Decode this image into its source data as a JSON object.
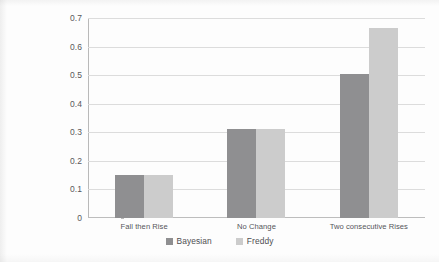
{
  "chart_data": {
    "type": "bar",
    "title": "",
    "subtitle": "",
    "xlabel": "",
    "ylabel": "",
    "ylim": [
      0,
      0.7
    ],
    "yticks": [
      "0",
      "0.1",
      "0.2",
      "0.3",
      "0.4",
      "0.5",
      "0.6",
      "0.7"
    ],
    "ytick_values": [
      0,
      0.1,
      0.2,
      0.3,
      0.4,
      0.5,
      0.6,
      0.7
    ],
    "grid": true,
    "legend_position": "bottom",
    "categories": [
      "Fall then Rise",
      "No Change",
      "Two consecutive Rises"
    ],
    "series": [
      {
        "name": "Bayesian",
        "color": "#8f8f91",
        "values": [
          0.15,
          0.31,
          0.505
        ]
      },
      {
        "name": "Freddy",
        "color": "#cccccc",
        "values": [
          0.152,
          0.312,
          0.665
        ]
      }
    ]
  },
  "axes": {
    "y_ticks": [
      {
        "label": "0.7",
        "value": 0.7
      },
      {
        "label": "0.6",
        "value": 0.6
      },
      {
        "label": "0.5",
        "value": 0.5
      },
      {
        "label": "0.4",
        "value": 0.4
      },
      {
        "label": "0.3",
        "value": 0.3
      },
      {
        "label": "0.2",
        "value": 0.2
      },
      {
        "label": "0.1",
        "value": 0.1
      },
      {
        "label": "0",
        "value": 0
      }
    ],
    "x_categories": [
      {
        "label": "Fall then Rise"
      },
      {
        "label": "No Change"
      },
      {
        "label": "Two consecutive Rises"
      }
    ]
  },
  "legend": {
    "items": [
      {
        "label": "Bayesian",
        "color": "#8f8f91"
      },
      {
        "label": "Freddy",
        "color": "#cccccc"
      }
    ]
  }
}
